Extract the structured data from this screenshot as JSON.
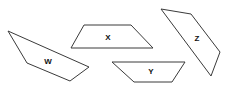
{
  "diagram": {
    "stroke_color": "#3a3a3a",
    "label_color": "#111111",
    "shapes": [
      {
        "id": "W",
        "label": "W",
        "points": "8,31 27,63 70,81 89,67",
        "label_pos": [
          48,
          61
        ]
      },
      {
        "id": "X",
        "label": "X",
        "points": "84,25 131,25 153,48 71,48",
        "label_pos": [
          108,
          37
        ]
      },
      {
        "id": "Y",
        "label": "Y",
        "points": "112,62 185,62 172,82 134,82",
        "label_pos": [
          151,
          71
        ]
      },
      {
        "id": "Z",
        "label": "Z",
        "points": "161,9 191,14 220,52 211,76",
        "label_pos": [
          197,
          38
        ]
      }
    ]
  }
}
